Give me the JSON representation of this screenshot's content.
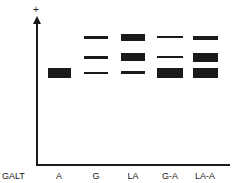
{
  "diagram": {
    "type": "gel-electrophoresis",
    "polarity_symbol": "+",
    "row_label": "GALT",
    "lanes": [
      {
        "label": "A",
        "center_x": 59,
        "bands": [
          {
            "y": 68,
            "h": 10,
            "w": 23
          }
        ]
      },
      {
        "label": "G",
        "center_x": 96,
        "bands": [
          {
            "y": 36,
            "h": 3,
            "w": 24
          },
          {
            "y": 56,
            "h": 3,
            "w": 24
          },
          {
            "y": 72,
            "h": 2,
            "w": 24
          }
        ]
      },
      {
        "label": "LA",
        "center_x": 133,
        "bands": [
          {
            "y": 34,
            "h": 7,
            "w": 24
          },
          {
            "y": 53,
            "h": 8,
            "w": 24
          },
          {
            "y": 71,
            "h": 3,
            "w": 24
          }
        ]
      },
      {
        "label": "G-A",
        "center_x": 170,
        "bands": [
          {
            "y": 36,
            "h": 2,
            "w": 26
          },
          {
            "y": 56,
            "h": 2,
            "w": 26
          },
          {
            "y": 68,
            "h": 10,
            "w": 26
          }
        ]
      },
      {
        "label": "LA-A",
        "center_x": 205,
        "bands": [
          {
            "y": 36,
            "h": 4,
            "w": 25
          },
          {
            "y": 53,
            "h": 9,
            "w": 25
          },
          {
            "y": 68,
            "h": 10,
            "w": 25
          }
        ]
      }
    ]
  }
}
